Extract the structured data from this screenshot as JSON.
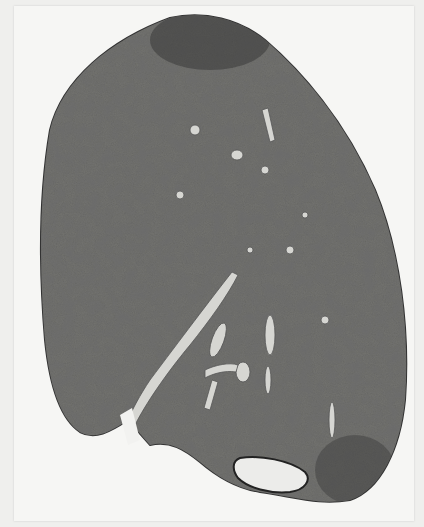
{
  "image": {
    "subject": "histological whole-mount section of lung tissue",
    "background_color": "#f4f4f2",
    "tissue_color": "#6e6e6c",
    "lesion_color": "#2e2e2e",
    "vessel_color": "#d8d8d4"
  }
}
